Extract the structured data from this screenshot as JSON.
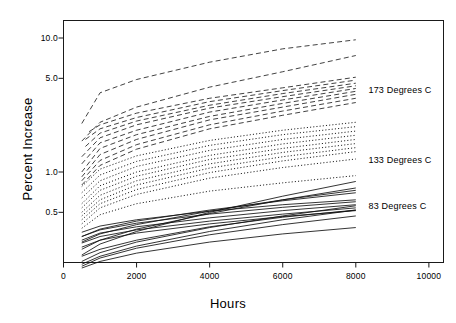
{
  "chart_data": {
    "type": "line",
    "title": "",
    "xlabel": "Hours",
    "ylabel": "Percent Increase",
    "xlim": [
      0,
      10400
    ],
    "ylim": [
      0.17,
      13.0
    ],
    "yscale": "log",
    "xscale": "linear",
    "grid": false,
    "legend_position": "right-inline",
    "xticks": [
      0,
      2000,
      4000,
      6000,
      8000,
      10000
    ],
    "xtick_labels": [
      "0",
      "2000",
      "4000",
      "6000",
      "8000",
      "10000"
    ],
    "yticks": [
      0.5,
      1.0,
      5.0,
      10.0
    ],
    "ytick_labels": [
      "0.5",
      "1.0",
      "5.0",
      "10.0"
    ],
    "annotations": [
      {
        "text": "173 Degrees C",
        "x": 8400,
        "y": 4.1
      },
      {
        "text": "133 Degrees C",
        "x": 8400,
        "y": 1.23
      },
      {
        "text": "83 Degrees C",
        "x": 8400,
        "y": 0.56
      }
    ],
    "groups": [
      {
        "name": "173 Degrees C",
        "label": "173 Degrees C",
        "linestyle": "dashed",
        "color": "#111111",
        "series": [
          {
            "name": "173C-1",
            "x": [
              500,
              1000,
              2000,
              4000,
              6000,
              8000
            ],
            "values": [
              2.3,
              3.9,
              4.9,
              6.6,
              8.3,
              9.7
            ]
          },
          {
            "name": "173C-2",
            "x": [
              500,
              1000,
              2000,
              4000,
              6000,
              8000
            ],
            "values": [
              1.7,
              2.35,
              3.05,
              4.3,
              5.6,
              7.4
            ]
          },
          {
            "name": "173C-3",
            "x": [
              700,
              1000,
              2000,
              4000,
              6000,
              8000
            ],
            "values": [
              2.0,
              2.25,
              2.75,
              3.55,
              4.25,
              5.1
            ]
          },
          {
            "name": "173C-4",
            "x": [
              600,
              1000,
              2000,
              4000,
              6000,
              8000
            ],
            "values": [
              1.75,
              2.1,
              2.55,
              3.35,
              4.05,
              4.85
            ]
          },
          {
            "name": "173C-5",
            "x": [
              600,
              1000,
              2000,
              4000,
              6000,
              8000
            ],
            "values": [
              1.55,
              1.95,
              2.4,
              3.15,
              3.85,
              4.6
            ]
          },
          {
            "name": "173C-6",
            "x": [
              500,
              1000,
              2000,
              4000,
              6000,
              8000
            ],
            "values": [
              1.3,
              1.8,
              2.25,
              3.0,
              3.65,
              4.4
            ]
          },
          {
            "name": "173C-7",
            "x": [
              500,
              1000,
              2000,
              4000,
              6000,
              8000
            ],
            "values": [
              1.15,
              1.65,
              2.05,
              2.8,
              3.45,
              4.2
            ]
          },
          {
            "name": "173C-8",
            "x": [
              500,
              1000,
              2000,
              4000,
              6000,
              8000
            ],
            "values": [
              1.0,
              1.5,
              1.9,
              2.6,
              3.25,
              4.0
            ]
          },
          {
            "name": "173C-9",
            "x": [
              500,
              1000,
              2000,
              4000,
              6000,
              8000
            ],
            "values": [
              0.92,
              1.35,
              1.75,
              2.45,
              3.05,
              3.8
            ]
          },
          {
            "name": "173C-10",
            "x": [
              500,
              1000,
              2000,
              4000,
              6000,
              8000
            ],
            "values": [
              0.86,
              1.22,
              1.6,
              2.25,
              2.85,
              3.55
            ]
          },
          {
            "name": "173C-11",
            "x": [
              500,
              1000,
              2000,
              4000,
              6000,
              8000
            ],
            "values": [
              0.8,
              1.12,
              1.48,
              2.1,
              2.65,
              3.3
            ]
          }
        ]
      },
      {
        "name": "133 Degrees C",
        "label": "133 Degrees C",
        "linestyle": "dotted",
        "color": "#111111",
        "series": [
          {
            "name": "133C-1",
            "x": [
              500,
              1000,
              2000,
              4000,
              6000,
              8000
            ],
            "values": [
              0.78,
              1.05,
              1.32,
              1.72,
              2.05,
              2.35
            ]
          },
          {
            "name": "133C-2",
            "x": [
              500,
              1000,
              2000,
              4000,
              6000,
              8000
            ],
            "values": [
              0.7,
              0.95,
              1.2,
              1.58,
              1.9,
              2.18
            ]
          },
          {
            "name": "133C-3",
            "x": [
              500,
              1000,
              2000,
              4000,
              6000,
              8000
            ],
            "values": [
              0.64,
              0.86,
              1.1,
              1.45,
              1.75,
              2.02
            ]
          },
          {
            "name": "133C-4",
            "x": [
              500,
              1000,
              2000,
              4000,
              6000,
              8000
            ],
            "values": [
              0.58,
              0.79,
              1.0,
              1.33,
              1.62,
              1.88
            ]
          },
          {
            "name": "133C-5",
            "x": [
              500,
              1000,
              2000,
              4000,
              6000,
              8000
            ],
            "values": [
              0.54,
              0.73,
              0.93,
              1.24,
              1.5,
              1.75
            ]
          },
          {
            "name": "133C-6",
            "x": [
              500,
              1000,
              2000,
              4000,
              6000,
              8000
            ],
            "values": [
              0.5,
              0.67,
              0.86,
              1.15,
              1.4,
              1.63
            ]
          },
          {
            "name": "133C-7",
            "x": [
              500,
              1000,
              2000,
              4000,
              6000,
              8000
            ],
            "values": [
              0.47,
              0.62,
              0.8,
              1.07,
              1.3,
              1.52
            ]
          },
          {
            "name": "133C-8",
            "x": [
              500,
              1000,
              2000,
              4000,
              6000,
              8000
            ],
            "values": [
              0.44,
              0.58,
              0.74,
              0.99,
              1.21,
              1.42
            ]
          },
          {
            "name": "133C-9",
            "x": [
              500,
              1000,
              2000,
              4000,
              6000,
              8000
            ],
            "values": [
              0.41,
              0.54,
              0.68,
              0.9,
              1.08,
              1.25
            ]
          },
          {
            "name": "133C-10",
            "x": [
              500,
              1000,
              2000,
              4000,
              6000,
              8000
            ],
            "values": [
              0.38,
              0.48,
              0.58,
              0.72,
              0.83,
              0.94
            ]
          }
        ]
      },
      {
        "name": "83 Degrees C",
        "label": "83 Degrees C",
        "linestyle": "solid",
        "color": "#111111",
        "series": [
          {
            "name": "83C-1",
            "x": [
              500,
              1000,
              2000,
              4000,
              6000,
              8000
            ],
            "values": [
              0.355,
              0.395,
              0.44,
              0.51,
              0.57,
              0.62
            ]
          },
          {
            "name": "83C-2",
            "x": [
              500,
              1000,
              2000,
              4000,
              6000,
              8000
            ],
            "values": [
              0.33,
              0.37,
              0.415,
              0.485,
              0.545,
              0.6
            ]
          },
          {
            "name": "83C-3",
            "x": [
              500,
              1000,
              2000,
              4000,
              6000,
              8000
            ],
            "values": [
              0.31,
              0.35,
              0.39,
              0.455,
              0.515,
              0.57
            ]
          },
          {
            "name": "83C-4",
            "x": [
              500,
              1000,
              2000,
              4000,
              6000,
              8000
            ],
            "values": [
              0.295,
              0.33,
              0.37,
              0.43,
              0.485,
              0.54
            ]
          },
          {
            "name": "83C-5",
            "x": [
              500,
              1000,
              2000,
              4000,
              6000,
              8000
            ],
            "values": [
              0.275,
              0.31,
              0.35,
              0.41,
              0.465,
              0.515
            ]
          },
          {
            "name": "83C-6",
            "x": [
              500,
              1000,
              2000,
              4000,
              6000,
              8000
            ],
            "values": [
              0.235,
              0.265,
              0.31,
              0.39,
              0.46,
              0.52
            ]
          },
          {
            "name": "83C-7",
            "x": [
              500,
              1000,
              2000,
              4000,
              6000,
              8000
            ],
            "values": [
              0.215,
              0.25,
              0.3,
              0.385,
              0.47,
              0.56
            ]
          },
          {
            "name": "83C-8",
            "x": [
              500,
              1000,
              2000,
              4000,
              6000,
              8000
            ],
            "values": [
              0.205,
              0.235,
              0.28,
              0.36,
              0.44,
              0.52
            ]
          },
          {
            "name": "83C-9",
            "x": [
              500,
              1000,
              2000,
              4000,
              6000,
              8000
            ],
            "values": [
              0.198,
              0.228,
              0.27,
              0.34,
              0.405,
              0.47
            ]
          },
          {
            "name": "83C-10",
            "x": [
              500,
              1000,
              2000,
              4000,
              6000,
              8000
            ],
            "values": [
              0.192,
              0.215,
              0.248,
              0.3,
              0.345,
              0.385
            ]
          },
          {
            "name": "83C-11",
            "x": [
              500,
              1000,
              2000,
              4000,
              6000,
              8000
            ],
            "values": [
              0.33,
              0.375,
              0.43,
              0.52,
              0.61,
              0.7
            ]
          },
          {
            "name": "83C-12",
            "x": [
              500,
              1000,
              2000,
              4000,
              6000,
              8000
            ],
            "values": [
              0.3,
              0.345,
              0.405,
              0.51,
              0.62,
              0.73
            ]
          },
          {
            "name": "83C-13",
            "x": [
              500,
              1000,
              2000,
              4000,
              6000,
              8000
            ],
            "values": [
              0.265,
              0.31,
              0.375,
              0.49,
              0.62,
              0.76
            ]
          },
          {
            "name": "83C-14",
            "x": [
              500,
              1000,
              2000,
              4000,
              6000,
              8000
            ],
            "values": [
              0.24,
              0.29,
              0.36,
              0.5,
              0.66,
              0.85
            ]
          }
        ]
      }
    ]
  }
}
